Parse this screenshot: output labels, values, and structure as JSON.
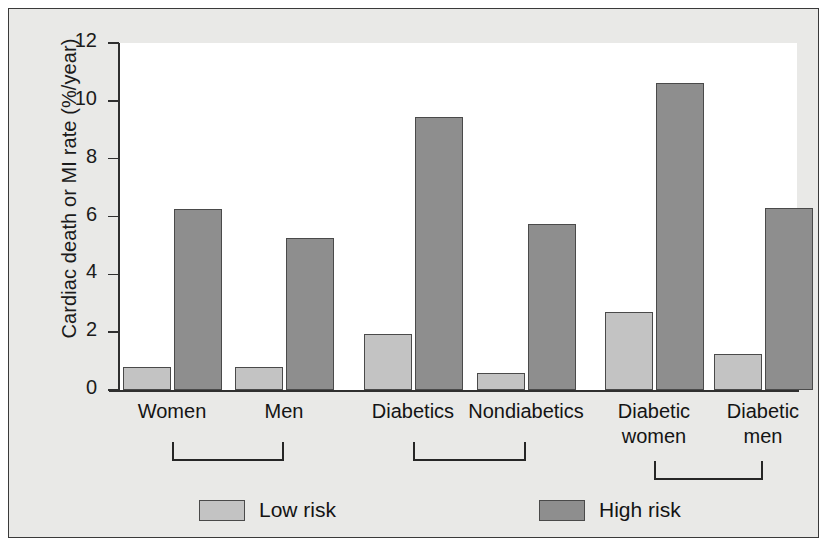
{
  "chart_data": {
    "type": "bar",
    "title": "",
    "xlabel": "",
    "ylabel": "Cardiac death or MI rate (%/year)",
    "ylim": [
      0,
      12
    ],
    "yticks": [
      0,
      2,
      4,
      6,
      8,
      10,
      12
    ],
    "ytick_labels": [
      "0",
      "2",
      "4",
      "6",
      "8",
      "10",
      "12"
    ],
    "grid": false,
    "legend_position": "bottom",
    "categories": [
      "Women",
      "Men",
      "Diabetics",
      "Nondiabetics",
      "Diabetic women",
      "Diabetic men"
    ],
    "category_lines": [
      [
        "Women"
      ],
      [
        "Men"
      ],
      [
        "Diabetics"
      ],
      [
        "Nondiabetics"
      ],
      [
        "Diabetic",
        "women"
      ],
      [
        "Diabetic",
        "men"
      ]
    ],
    "series": [
      {
        "name": "Low risk",
        "color": "#c3c3c3",
        "values": [
          0.8,
          0.8,
          1.95,
          0.6,
          2.7,
          1.25
        ]
      },
      {
        "name": "High risk",
        "color": "#8e8e8e",
        "values": [
          6.25,
          5.25,
          9.45,
          5.75,
          10.6,
          6.3
        ]
      }
    ],
    "groups": [
      {
        "label": "",
        "categories": [
          "Women",
          "Men"
        ]
      },
      {
        "label": "",
        "categories": [
          "Diabetics",
          "Nondiabetics"
        ]
      },
      {
        "label": "",
        "categories": [
          "Diabetic women",
          "Diabetic men"
        ]
      }
    ]
  },
  "legend": {
    "items": [
      {
        "label": "Low risk",
        "swatch": "low"
      },
      {
        "label": "High risk",
        "swatch": "high"
      }
    ]
  }
}
